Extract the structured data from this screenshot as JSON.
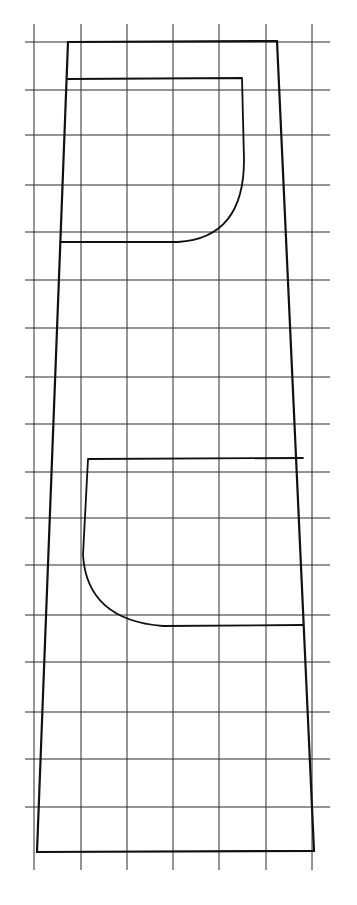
{
  "diagram": {
    "type": "pattern-drawing-on-grid",
    "background": "#ffffff",
    "line_color": "#111111",
    "grid": {
      "vertical_x": [
        34,
        81,
        127,
        173,
        219,
        266,
        312
      ],
      "vertical_extent": [
        24,
        870
      ],
      "horizontal_y": [
        42,
        90,
        135,
        185,
        232,
        280,
        328,
        377,
        424,
        472,
        518,
        565,
        615,
        662,
        712,
        759,
        807
      ],
      "horizontal_extent": [
        25,
        330
      ]
    },
    "outer_panel": {
      "shape": "trapezoid",
      "points": [
        [
          68,
          42
        ],
        [
          277,
          41
        ],
        [
          314,
          851
        ],
        [
          37,
          852
        ]
      ]
    },
    "upper_pocket": {
      "path": "M 67 79 L 242 78 L 244 160 Q 244 238 178 242 L 60 242"
    },
    "lower_pocket": {
      "path": "M 303 458 L 88 459 L 83 555 Q 87 620 163 626 L 303 625"
    }
  }
}
